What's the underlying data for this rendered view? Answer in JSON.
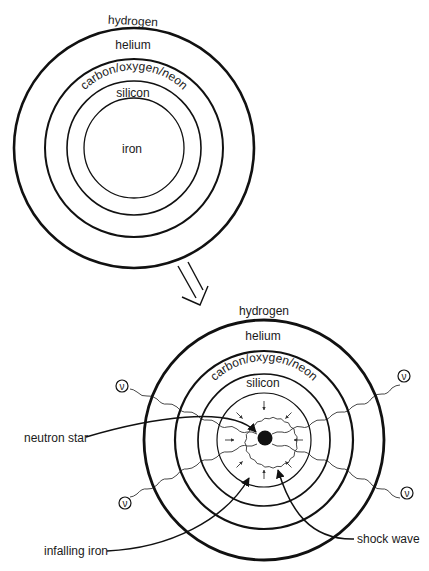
{
  "before": {
    "layers": [
      {
        "name": "hydrogen",
        "label": "hydrogen"
      },
      {
        "name": "helium",
        "label": "helium"
      },
      {
        "name": "carbon-oxygen-neon",
        "label": "carbon/oxygen/neon"
      },
      {
        "name": "silicon",
        "label": "silicon"
      },
      {
        "name": "iron",
        "label": "iron"
      }
    ]
  },
  "transition_arrow": "double-arrow-down-right",
  "after": {
    "layers": [
      {
        "name": "hydrogen",
        "label": "hydrogen"
      },
      {
        "name": "helium",
        "label": "helium"
      },
      {
        "name": "carbon-oxygen-neon",
        "label": "carbon/oxygen/neon"
      },
      {
        "name": "silicon",
        "label": "silicon"
      }
    ],
    "callouts": {
      "neutron_star": "neutron star",
      "infalling_iron": "infalling iron",
      "shock_wave": "shock wave"
    },
    "neutrino_symbol": "ν",
    "neutrino_count": 4
  },
  "colors": {
    "line": "#111111",
    "background": "#ffffff"
  }
}
